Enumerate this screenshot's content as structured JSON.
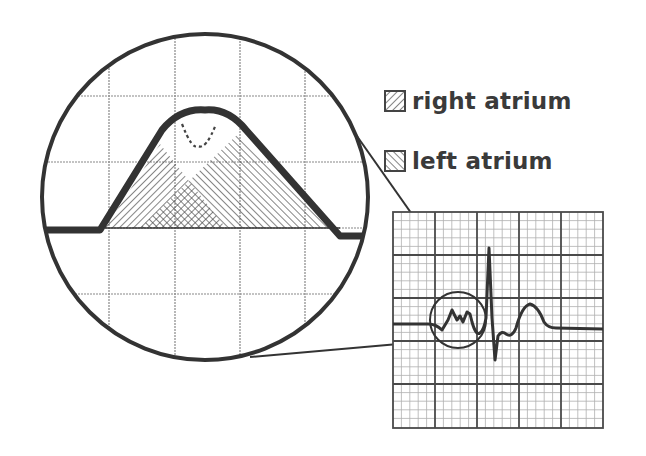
{
  "diagram": {
    "title": "",
    "legend": [
      {
        "key": "right_atrium",
        "label": "right atrium",
        "pattern": "hatch-backslash"
      },
      {
        "key": "left_atrium",
        "label": "left atrium",
        "pattern": "hatch-slash"
      }
    ],
    "magnified_view": {
      "description": "Magnified P wave showing overlapping right and left atrial depolarization",
      "shape": "circle",
      "grid_columns": 5,
      "grid_rows": 5,
      "notch": "dashed notch at top of P wave"
    },
    "ecg_strip": {
      "description": "ECG trace on grid paper with P wave, QRS complex and T wave",
      "major_grid": 5,
      "minor_per_major": 5,
      "components": [
        "P wave",
        "QRS complex",
        "T wave"
      ]
    },
    "colors": {
      "stroke": "#333333",
      "grid_major": "#555555",
      "grid_minor": "#aaaaaa",
      "background": "#ffffff"
    }
  }
}
